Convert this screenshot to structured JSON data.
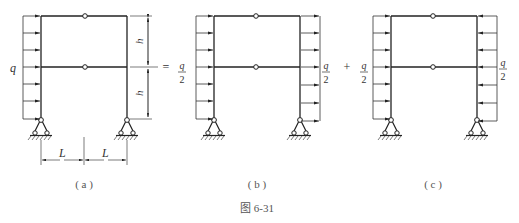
{
  "figure": {
    "caption": "图 6-31",
    "equals_sign": "=",
    "plus_sign": "+"
  },
  "subfigures": [
    {
      "id": "a",
      "label": "( a )",
      "load_label": "q",
      "load_direction": "right",
      "load_side": "left",
      "dims": {
        "h_top": "h",
        "h_bottom": "h",
        "L_left": "L",
        "L_right": "L"
      }
    },
    {
      "id": "b",
      "label": "( b )",
      "left_load": {
        "num": "q",
        "den": "2",
        "direction": "right"
      },
      "right_load": {
        "num": "q",
        "den": "2",
        "direction": "right"
      }
    },
    {
      "id": "c",
      "label": "( c )",
      "left_load": {
        "num": "q",
        "den": "2",
        "direction": "right"
      },
      "right_load": {
        "num": "q",
        "den": "2",
        "direction": "left"
      }
    }
  ],
  "colors": {
    "line": "#222222",
    "thin": "#444444"
  }
}
